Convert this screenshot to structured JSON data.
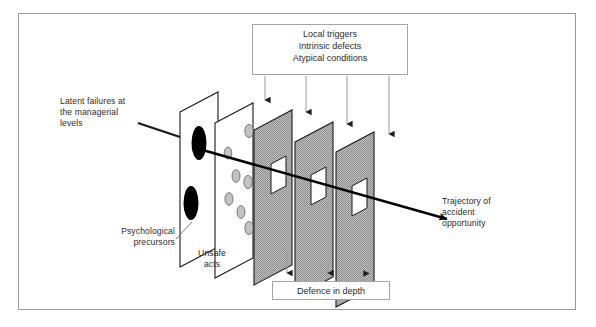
{
  "figure": {
    "background_color": "#ffffff",
    "border_color": "#9a9a9a"
  },
  "boxes": {
    "top": {
      "name": "local-triggers-box",
      "lines": "Local triggers\nIntrinsic defects\nAtypical conditions",
      "arrow_count": 4
    },
    "bottom": {
      "name": "defence-in-depth-box",
      "lines": "Defence in depth",
      "arrow_count": 3
    }
  },
  "labels": {
    "latent_failures": "Latent failures at\nthe managerial\nlevels",
    "psychological_precursors": "Psychological\nprecursors",
    "unsafe_acts": "Unsafe\nacts",
    "trajectory": "Trajectory of\naccident\nopportunity"
  },
  "colors": {
    "plane_white_fill": "#ffffff",
    "plane_gray_fill": "#a9a9a9",
    "plane_stroke": "#1a1a1a",
    "hole_black": "#000000",
    "hole_gray": "#b0b0b0",
    "trajectory_line": "#000000",
    "arrow_gray": "#8d8d8d",
    "text": "#2b2b2b"
  },
  "planes": [
    {
      "name": "plane-latent-failures",
      "fill": "white",
      "holes": "2 large black ellipses",
      "hole_count": 2
    },
    {
      "name": "plane-psychological-precursors",
      "fill": "white",
      "holes": "7 small gray ellipses",
      "hole_count": 7
    },
    {
      "name": "plane-defence-1",
      "fill": "gray",
      "holes": "1 square hole",
      "hole_count": 1
    },
    {
      "name": "plane-defence-2",
      "fill": "gray",
      "holes": "1 square hole",
      "hole_count": 1
    },
    {
      "name": "plane-defence-3",
      "fill": "gray",
      "holes": "1 square hole",
      "hole_count": 1
    }
  ]
}
